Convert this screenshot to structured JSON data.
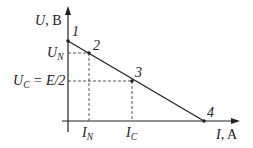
{
  "diagram": {
    "type": "voltage-current characteristic (load line)",
    "colors": {
      "axis": "#222222",
      "line": "#222222",
      "dashed": "#444444",
      "background": "#ffffff"
    },
    "y_axis": {
      "var": "U",
      "unit": ", B"
    },
    "x_axis": {
      "var": "I",
      "unit": ", A"
    },
    "points": [
      {
        "id": "1",
        "label": "1"
      },
      {
        "id": "2",
        "label": "2"
      },
      {
        "id": "3",
        "label": "3"
      },
      {
        "id": "4",
        "label": "4"
      }
    ],
    "y_ticks": [
      {
        "main": "U",
        "sub": "N"
      },
      {
        "main": "U",
        "sub": "C",
        "suffix": " = E/2"
      }
    ],
    "x_ticks": [
      {
        "main": "I",
        "sub": "N"
      },
      {
        "main": "I",
        "sub": "C"
      }
    ]
  }
}
